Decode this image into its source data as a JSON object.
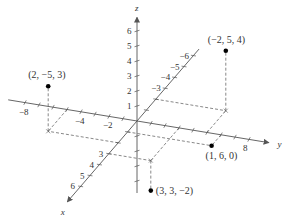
{
  "diagram": {
    "type": "3d-coordinate-system",
    "origin_px": [
      137,
      121
    ],
    "unit_vectors_px": {
      "x": [
        -9.4,
        10.9
      ],
      "y": [
        14.0,
        2.3
      ],
      "z": [
        0,
        -15.0
      ]
    },
    "axes": {
      "x": {
        "label": "x",
        "ticks": [
          3,
          4,
          5,
          6
        ],
        "tick_labels": [
          "3",
          "4",
          "5",
          "6"
        ],
        "neg_ticks": [
          -3,
          -4,
          -5,
          -6
        ],
        "neg_tick_labels": [
          "-3",
          "-4",
          "-5",
          "-6"
        ]
      },
      "y": {
        "label": "y",
        "ticks": [
          -8,
          -4,
          -2,
          8
        ],
        "tick_labels": [
          "-8",
          "-4",
          "-2",
          "8"
        ]
      },
      "z": {
        "label": "z",
        "ticks": [
          1,
          2,
          3,
          4,
          5,
          6
        ],
        "tick_labels": [
          "1",
          "2",
          "3",
          "4",
          "5",
          "6"
        ]
      }
    },
    "points": [
      {
        "coords": [
          2,
          -5,
          3
        ],
        "label": "(2, −5, 3)"
      },
      {
        "coords": [
          -2,
          5,
          4
        ],
        "label": "(−2, 5, 4)"
      },
      {
        "coords": [
          1,
          6,
          0
        ],
        "label": "(1, 6, 0)"
      },
      {
        "coords": [
          3,
          3,
          -2
        ],
        "label": "(3, 3, −2)"
      }
    ],
    "colors": {
      "axis": "#555555",
      "dashed": "#555555",
      "point": "#000000",
      "text": "#333333"
    }
  }
}
